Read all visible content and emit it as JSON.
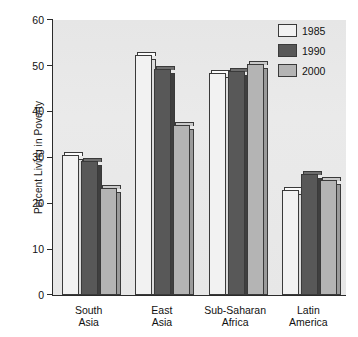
{
  "chart_data": {
    "type": "bar",
    "title": "",
    "xlabel": "",
    "ylabel": "Percent Living in Poverty",
    "ylim": [
      0,
      60
    ],
    "yticks": [
      0,
      10,
      20,
      30,
      40,
      50,
      60
    ],
    "grid": false,
    "legend_position": "top-right",
    "categories": [
      "South\nAsia",
      "East\nAsia",
      "Sub-Saharan\nAfrica",
      "Latin\nAmerica"
    ],
    "category_labels": [
      {
        "line1": "South",
        "line2": "Asia"
      },
      {
        "line1": "East",
        "line2": "Asia"
      },
      {
        "line1": "Sub-Saharan",
        "line2": "Africa"
      },
      {
        "line1": "Latin",
        "line2": "America"
      }
    ],
    "series": [
      {
        "name": "1985",
        "color": "#f2f2f2",
        "values": [
          30.5,
          52.3,
          48.5,
          23.0
        ]
      },
      {
        "name": "1990",
        "color": "#585858",
        "values": [
          29.3,
          49.4,
          48.8,
          26.3
        ]
      },
      {
        "name": "2000",
        "color": "#b4b4b4",
        "values": [
          23.3,
          37.0,
          50.4,
          25.0
        ]
      }
    ]
  },
  "legend": {
    "items": [
      {
        "label": "1985"
      },
      {
        "label": "1990"
      },
      {
        "label": "2000"
      }
    ]
  },
  "axis": {
    "y_label": "Percent Living in Poverty",
    "y_ticks": [
      "60",
      "50",
      "40",
      "30",
      "20",
      "10",
      "0"
    ]
  }
}
